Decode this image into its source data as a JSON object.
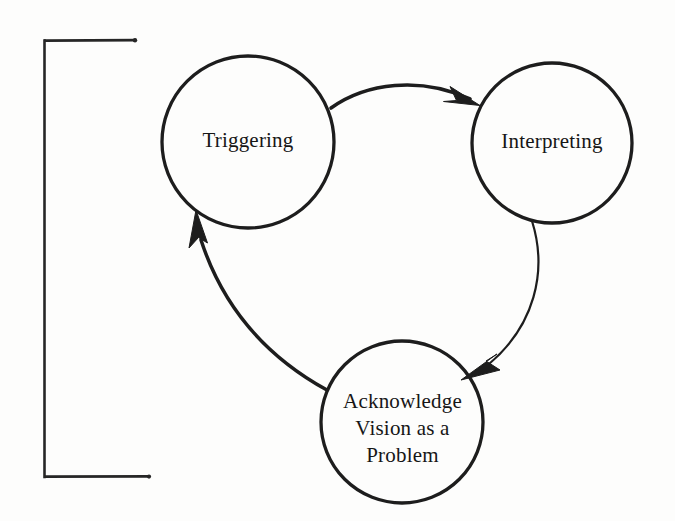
{
  "figure": {
    "type": "cycle-diagram",
    "background_color": "#fdfdfc",
    "ink_color": "#1f1f1f"
  },
  "nodes": [
    {
      "id": "triggering",
      "label": "Triggering",
      "shape": "circle",
      "cx": 248,
      "cy": 142,
      "r": 86,
      "stroke_width": 3.2
    },
    {
      "id": "interpreting",
      "label": "Interpreting",
      "shape": "circle",
      "cx": 552,
      "cy": 143,
      "r": 80,
      "stroke_width": 3.2
    },
    {
      "id": "acknowledge-vision-as-a-problem",
      "label_lines": [
        "Acknowledge",
        "Vision as a",
        "Problem"
      ],
      "label": "Acknowledge Vision as a Problem",
      "shape": "circle",
      "cx": 402,
      "cy": 422,
      "r": 81,
      "stroke_width": 3.2
    }
  ],
  "edges": [
    {
      "id": "triggering-to-interpreting",
      "from": "triggering",
      "to": "interpreting",
      "style": "curved-arrow",
      "stroke_width": 3.4,
      "arrowhead": "barbed"
    },
    {
      "id": "interpreting-to-acknowledge",
      "from": "interpreting",
      "to": "acknowledge-vision-as-a-problem",
      "style": "curved-arrow",
      "stroke_width": 2.1,
      "arrowhead": "barbed"
    },
    {
      "id": "acknowledge-to-triggering",
      "from": "acknowledge-vision-as-a-problem",
      "to": "triggering",
      "style": "curved-arrow",
      "stroke_width": 3.4,
      "arrowhead": "barbed"
    }
  ],
  "bracket": {
    "id": "left-bracket",
    "orientation": "left",
    "x": 44,
    "top_y": 40,
    "bottom_y": 477,
    "top_arm_end_x": 136,
    "bottom_arm_end_x": 150,
    "stroke_width": 2.4
  }
}
